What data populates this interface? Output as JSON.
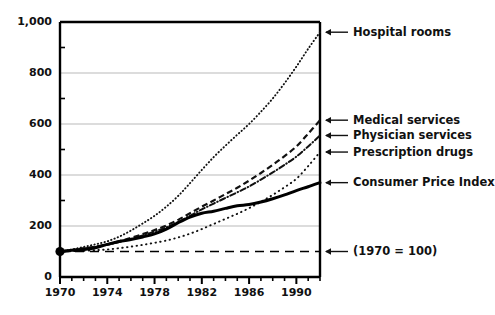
{
  "chart_data": {
    "type": "line",
    "title": "",
    "subtitle": "",
    "xlabel": "",
    "ylabel": "",
    "note": "(1970 = 100)",
    "xlim": [
      1970,
      1992
    ],
    "ylim": [
      0,
      1000
    ],
    "grid": "horizontal",
    "legend_position": "right-of-plot-with-arrows",
    "y_ticks": [
      "0",
      "200",
      "400",
      "600",
      "800",
      "1,000"
    ],
    "y_tick_values": [
      0,
      200,
      400,
      600,
      800,
      1000
    ],
    "x_ticks": [
      "1970",
      "1974",
      "1978",
      "1982",
      "1986",
      "1990"
    ],
    "x_tick_values": [
      1970,
      1974,
      1978,
      1982,
      1986,
      1990
    ],
    "x_minor_tick_step": 1,
    "baseline": {
      "label": "(1970 = 100)",
      "value": 100,
      "style": "dashed"
    },
    "origin_marker": {
      "x": 1970,
      "y": 100,
      "style": "filled-circle"
    },
    "x": [
      1970,
      1971,
      1972,
      1973,
      1974,
      1975,
      1976,
      1977,
      1978,
      1979,
      1980,
      1981,
      1982,
      1983,
      1984,
      1985,
      1986,
      1987,
      1988,
      1989,
      1990,
      1991,
      1992
    ],
    "series": [
      {
        "name": "Hospital rooms",
        "style": "dotted",
        "color": "#111111",
        "end_value": 960,
        "values": [
          100,
          108,
          118,
          128,
          140,
          158,
          182,
          210,
          240,
          276,
          318,
          368,
          420,
          470,
          515,
          558,
          600,
          648,
          700,
          760,
          825,
          895,
          960
        ]
      },
      {
        "name": "Medical services",
        "style": "dashed",
        "color": "#111111",
        "end_value": 615,
        "values": [
          100,
          106,
          112,
          119,
          128,
          140,
          153,
          168,
          184,
          202,
          224,
          250,
          276,
          300,
          325,
          350,
          378,
          408,
          440,
          474,
          512,
          562,
          615
        ]
      },
      {
        "name": "Physician services",
        "style": "dash-dot",
        "color": "#111111",
        "end_value": 555,
        "values": [
          100,
          106,
          112,
          118,
          126,
          137,
          149,
          163,
          178,
          195,
          215,
          240,
          265,
          288,
          310,
          332,
          355,
          382,
          410,
          440,
          472,
          512,
          555
        ]
      },
      {
        "name": "Prescription drugs",
        "style": "dotted-sparse",
        "color": "#111111",
        "end_value": 490,
        "values": [
          100,
          101,
          103,
          105,
          108,
          113,
          119,
          126,
          134,
          143,
          155,
          170,
          188,
          208,
          228,
          248,
          270,
          295,
          322,
          352,
          385,
          435,
          490
        ]
      },
      {
        "name": "Consumer Price Index",
        "style": "solid-thick",
        "color": "#000000",
        "end_value": 370,
        "values": [
          100,
          105,
          108,
          115,
          128,
          139,
          147,
          157,
          169,
          188,
          213,
          235,
          250,
          258,
          269,
          279,
          284,
          294,
          307,
          322,
          339,
          354,
          370
        ]
      }
    ],
    "callouts": [
      {
        "label": "Hospital rooms",
        "target_value": 960
      },
      {
        "label": "Medical services",
        "target_value": 615
      },
      {
        "label": "Physician services",
        "target_value": 555
      },
      {
        "label": "Prescription drugs",
        "target_value": 490
      },
      {
        "label": "Consumer Price Index",
        "target_value": 370
      },
      {
        "label": "(1970 = 100)",
        "target_value": 100
      }
    ]
  }
}
